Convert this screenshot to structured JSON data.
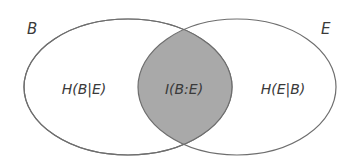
{
  "diagram": {
    "type": "venn",
    "sets": [
      {
        "id": "B",
        "label": "B",
        "region_label": "H(B|E)"
      },
      {
        "id": "E",
        "label": "E",
        "region_label": "H(E|B)"
      }
    ],
    "intersection": {
      "label": "I(B:E)",
      "fill": "#a9a9a9"
    },
    "colors": {
      "stroke": "#6e6e6e",
      "background": "#ffffff",
      "text": "#3a3a3a"
    }
  }
}
